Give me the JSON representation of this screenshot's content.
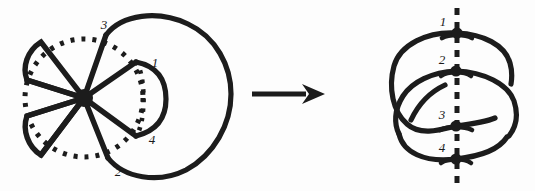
{
  "figure": {
    "background_color": "#fdfdfd",
    "ink_color": "#1c1c1c",
    "arrow": {
      "name": "transformation-arrow",
      "direction": "right",
      "label": ""
    },
    "left_diagram": {
      "name": "flower-petal-diagram",
      "description": "Hub with radiating spokes forming petals, a dotted circle through petal tips, and a large outer closed curve on the right",
      "hub_label": "",
      "labels": [
        {
          "id": "l1",
          "text": "1",
          "x": 155,
          "y": 67
        },
        {
          "id": "l2",
          "text": "2",
          "x": 118,
          "y": 176
        },
        {
          "id": "l3",
          "text": "3",
          "x": 104,
          "y": 29
        },
        {
          "id": "l4",
          "text": "4",
          "x": 152,
          "y": 144
        }
      ]
    },
    "right_diagram": {
      "name": "linked-loops-diagram",
      "description": "Two interlocking loops crossing a vertical dashed axis at four marked nodes",
      "axis_style": "dashed",
      "nodes": [
        {
          "id": "n1",
          "label": "1",
          "x": 457,
          "y": 33,
          "label_x": 443,
          "label_y": 26
        },
        {
          "id": "n2",
          "label": "2",
          "x": 456,
          "y": 71,
          "label_x": 442,
          "label_y": 64
        },
        {
          "id": "n3",
          "label": "3",
          "x": 456,
          "y": 126,
          "label_x": 442,
          "label_y": 119
        },
        {
          "id": "n4",
          "label": "4",
          "x": 456,
          "y": 159,
          "label_x": 442,
          "label_y": 152
        }
      ]
    }
  }
}
